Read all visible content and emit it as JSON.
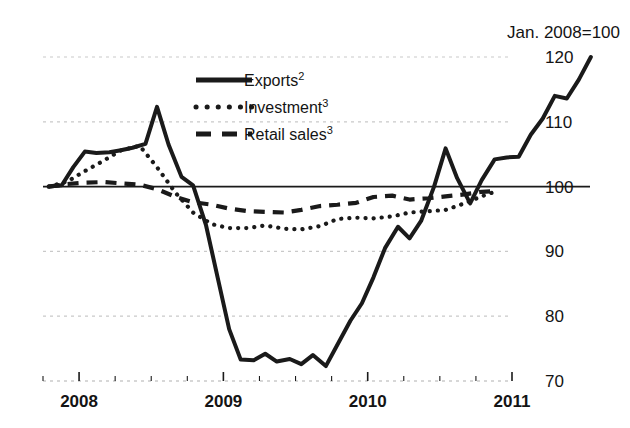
{
  "chart_data": {
    "type": "line",
    "title": "Jan. 2008=100",
    "xlabel": "",
    "ylabel": "",
    "ylim": [
      70,
      120
    ],
    "xlim": [
      2007.75,
      2011.0
    ],
    "grid": true,
    "legend_position": "upper-left-inside",
    "y_ticks": [
      "120",
      "110",
      "100",
      "90",
      "80",
      "70"
    ],
    "y_tick_values": [
      120,
      110,
      100,
      90,
      80,
      70
    ],
    "x_ticks": [
      "2008",
      "2009",
      "2010",
      "2011"
    ],
    "x_tick_values": [
      2008,
      2009,
      2010,
      2011
    ],
    "baseline_value": 100,
    "series": [
      {
        "name": "Exports²",
        "label_base": "Exports",
        "label_sup": "2",
        "style": "solid",
        "color": "#1a1a1a",
        "x": [
          2007.79,
          2007.88,
          2007.96,
          2008.04,
          2008.12,
          2008.21,
          2008.29,
          2008.37,
          2008.46,
          2008.54,
          2008.62,
          2008.71,
          2008.79,
          2008.88,
          2008.96,
          2009.04,
          2009.12,
          2009.21,
          2009.29,
          2009.37,
          2009.46,
          2009.54,
          2009.62,
          2009.71,
          2009.79,
          2009.88,
          2009.96,
          2010.04,
          2010.12,
          2010.21,
          2010.29,
          2010.37,
          2010.46,
          2010.54,
          2010.62,
          2010.71,
          2010.79,
          2010.88
        ],
        "values": [
          100.0,
          100.2,
          103.0,
          105.4,
          105.2,
          105.3,
          105.6,
          106.0,
          106.6,
          112.3,
          106.5,
          101.5,
          100.2,
          94.0,
          86.0,
          78.0,
          73.3,
          73.2,
          74.2,
          73.0,
          73.4,
          72.6,
          74.0,
          72.3,
          75.6,
          79.3,
          82.0,
          86.0,
          90.5,
          93.8,
          92.0,
          94.7,
          100.0,
          105.9,
          101.3,
          97.4,
          101.0,
          104.2
        ],
        "values_tail": [
          104.5,
          104.6,
          108.0,
          110.5,
          114.0,
          113.6,
          116.5,
          120.0
        ]
      },
      {
        "name": "Investment³",
        "label_base": "Investment",
        "label_sup": "3",
        "style": "dotted",
        "color": "#1a1a1a",
        "x": [
          2007.79,
          2007.92,
          2008.04,
          2008.17,
          2008.29,
          2008.42,
          2008.54,
          2008.67,
          2008.79,
          2008.92,
          2009.04,
          2009.17,
          2009.29,
          2009.42,
          2009.54,
          2009.67,
          2009.79,
          2009.92,
          2010.04,
          2010.17,
          2010.29,
          2010.42,
          2010.54,
          2010.67,
          2010.79,
          2010.88
        ],
        "values": [
          100.0,
          100.8,
          102.4,
          104.0,
          105.6,
          106.3,
          103.0,
          99.0,
          96.0,
          94.2,
          93.6,
          93.6,
          94.0,
          93.5,
          93.4,
          93.9,
          95.0,
          95.2,
          95.1,
          95.4,
          96.0,
          96.2,
          96.4,
          97.4,
          98.5,
          99.2
        ]
      },
      {
        "name": "Retail sales³",
        "label_base": "Retail sales",
        "label_sup": "3",
        "style": "dashed",
        "color": "#1a1a1a",
        "x": [
          2007.79,
          2007.92,
          2008.04,
          2008.17,
          2008.29,
          2008.42,
          2008.54,
          2008.67,
          2008.79,
          2008.92,
          2009.04,
          2009.17,
          2009.29,
          2009.42,
          2009.54,
          2009.67,
          2009.79,
          2009.92,
          2010.04,
          2010.17,
          2010.29,
          2010.42,
          2010.54,
          2010.67,
          2010.79,
          2010.88
        ],
        "values": [
          100.0,
          100.4,
          100.6,
          100.7,
          100.5,
          100.3,
          99.6,
          98.4,
          97.6,
          97.2,
          96.6,
          96.2,
          96.1,
          96.0,
          96.4,
          97.0,
          97.2,
          97.5,
          98.4,
          98.6,
          98.0,
          98.2,
          98.5,
          98.8,
          99.2,
          99.3
        ]
      }
    ]
  },
  "legend": {
    "items": [
      {
        "label": "Exports",
        "sup": "2",
        "style": "solid"
      },
      {
        "label": "Investment",
        "sup": "3",
        "style": "dotted"
      },
      {
        "label": "Retail sales",
        "sup": "3",
        "style": "dashed"
      }
    ]
  },
  "colors": {
    "line": "#1a1a1a",
    "grid": "#c9c9c9",
    "axis": "#1a1a1a",
    "background": "#ffffff"
  }
}
